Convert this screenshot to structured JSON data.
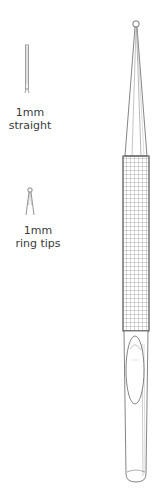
{
  "variants": [
    {
      "size": "1mm",
      "type": "straight",
      "icon": "straight-tip-icon"
    },
    {
      "size": "1mm",
      "type": "ring tips",
      "icon": "ring-tip-icon"
    }
  ],
  "instrument": {
    "icon": "knurled-handle-instrument-icon"
  },
  "colors": {
    "line": "#555555",
    "background": "#ffffff"
  }
}
